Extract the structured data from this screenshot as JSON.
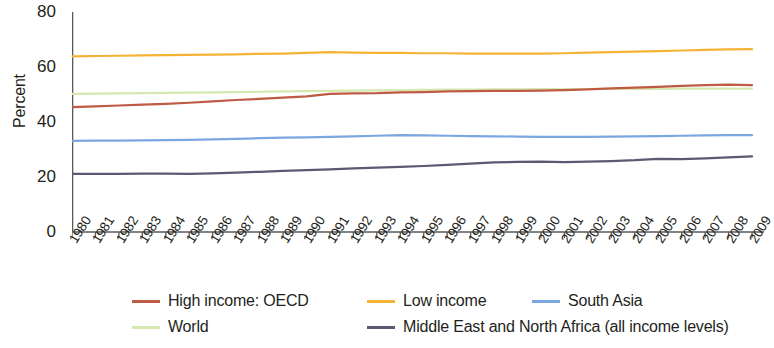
{
  "chart_data": {
    "type": "line",
    "title": "",
    "subtitle": "",
    "xlabel": "",
    "ylabel": "Percent",
    "ylim": [
      0,
      80
    ],
    "yticks": [
      0,
      20,
      40,
      60,
      80
    ],
    "xlim": [
      1980,
      2009
    ],
    "grid": false,
    "legend_position": "bottom",
    "x": [
      1980,
      1981,
      1982,
      1983,
      1984,
      1985,
      1986,
      1987,
      1988,
      1989,
      1990,
      1991,
      1992,
      1993,
      1994,
      1995,
      1996,
      1997,
      1998,
      1999,
      2000,
      2001,
      2002,
      2003,
      2004,
      2005,
      2006,
      2007,
      2008,
      2009
    ],
    "categories": [
      "1980",
      "1981",
      "1982",
      "1983",
      "1984",
      "1985",
      "1986",
      "1987",
      "1988",
      "1989",
      "1990",
      "1991",
      "1992",
      "1993",
      "1994",
      "1995",
      "1996",
      "1997",
      "1998",
      "1999",
      "2000",
      "2001",
      "2002",
      "2003",
      "2004",
      "2005",
      "2006",
      "2007",
      "2008",
      "2009"
    ],
    "series": [
      {
        "name": "High income: OECD",
        "color": "#bf5a44",
        "values": [
          45.4,
          45.7,
          46.0,
          46.3,
          46.6,
          47.0,
          47.5,
          48.0,
          48.4,
          48.9,
          49.3,
          50.2,
          50.4,
          50.5,
          50.8,
          50.9,
          51.1,
          51.2,
          51.3,
          51.3,
          51.4,
          51.6,
          51.9,
          52.2,
          52.5,
          52.8,
          53.1,
          53.4,
          53.6,
          53.4
        ]
      },
      {
        "name": "Low income",
        "color": "#f5b335",
        "values": [
          63.9,
          64.0,
          64.1,
          64.2,
          64.3,
          64.4,
          64.5,
          64.6,
          64.8,
          64.9,
          65.1,
          65.4,
          65.2,
          65.1,
          65.1,
          65.0,
          65.0,
          64.9,
          64.9,
          64.9,
          64.9,
          65.0,
          65.2,
          65.4,
          65.6,
          65.8,
          66.0,
          66.2,
          66.4,
          66.5
        ]
      },
      {
        "name": "South Asia",
        "color": "#7ba7e0",
        "values": [
          33.1,
          33.2,
          33.2,
          33.3,
          33.4,
          33.5,
          33.7,
          33.9,
          34.1,
          34.3,
          34.4,
          34.6,
          34.8,
          35.0,
          35.2,
          35.1,
          35.0,
          34.9,
          34.8,
          34.7,
          34.6,
          34.6,
          34.6,
          34.7,
          34.8,
          34.9,
          35.0,
          35.1,
          35.2,
          35.2
        ]
      },
      {
        "name": "World",
        "color": "#d5e8b0",
        "values": [
          50.2,
          50.3,
          50.4,
          50.5,
          50.6,
          50.7,
          50.8,
          50.9,
          51.0,
          51.1,
          51.2,
          51.3,
          51.4,
          51.5,
          51.6,
          51.7,
          51.8,
          51.8,
          51.9,
          51.9,
          52.0,
          52.0,
          52.0,
          52.0,
          52.0,
          52.0,
          52.1,
          52.1,
          52.1,
          52.1
        ]
      },
      {
        "name": "Middle East and North Africa (all income levels)",
        "color": "#5a5a72",
        "values": [
          21.1,
          21.1,
          21.1,
          21.2,
          21.2,
          21.1,
          21.3,
          21.6,
          21.9,
          22.2,
          22.5,
          22.8,
          23.1,
          23.4,
          23.7,
          24.0,
          24.4,
          24.9,
          25.3,
          25.5,
          25.6,
          25.4,
          25.6,
          25.8,
          26.1,
          26.6,
          26.5,
          26.8,
          27.1,
          27.5
        ]
      }
    ]
  },
  "legend": {
    "row1": [
      {
        "label": "High income: OECD",
        "color": "#bf5a44",
        "x": 0
      },
      {
        "label": "Low income",
        "color": "#f5b335",
        "x": 235
      },
      {
        "label": "South Asia",
        "color": "#7ba7e0",
        "x": 400
      }
    ],
    "row2": [
      {
        "label": "World",
        "color": "#d5e8b0",
        "x": 0
      },
      {
        "label": "Middle East and North Africa (all income levels)",
        "color": "#5a5a72",
        "x": 235
      }
    ]
  },
  "axis": {
    "y_label": "Percent",
    "axis_color": "#58595b"
  }
}
